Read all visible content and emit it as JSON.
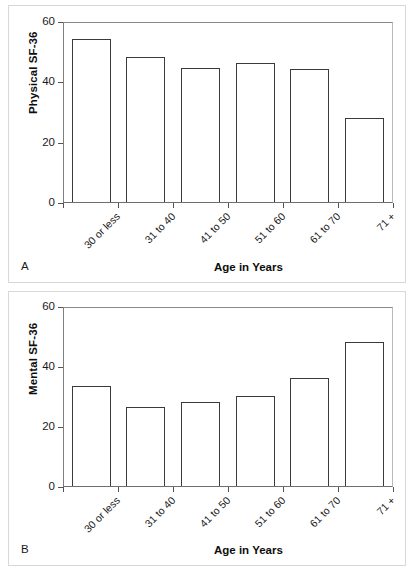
{
  "figure": {
    "panels": [
      {
        "letter": "A",
        "y_title": "Physical SF-36",
        "x_title": "Age in Years"
      },
      {
        "letter": "B",
        "y_title": "Mental SF-36",
        "x_title": "Age in Years"
      }
    ]
  },
  "chart_data": [
    {
      "type": "bar",
      "title": "A",
      "panel_letter": "A",
      "categories": [
        "30 or less",
        "31 to 40",
        "41 to 50",
        "51 to 60",
        "61 to 70",
        "71 +"
      ],
      "values": [
        54,
        48,
        44.5,
        46,
        44,
        28
      ],
      "xlabel": "Age in Years",
      "ylabel": "Physical SF-36",
      "ylim": [
        0,
        60
      ],
      "yticks": [
        0,
        20,
        40,
        60
      ],
      "ytick_labels": [
        "0",
        "20",
        "40",
        "60"
      ],
      "grid": false,
      "legend": false
    },
    {
      "type": "bar",
      "title": "B",
      "panel_letter": "B",
      "categories": [
        "30 or less",
        "31 to 40",
        "41 to 50",
        "51 to 60",
        "61 to 70",
        "71 +"
      ],
      "values": [
        33.5,
        26.5,
        28,
        30,
        36,
        48
      ],
      "xlabel": "Age in Years",
      "ylabel": "Mental SF-36",
      "ylim": [
        0,
        60
      ],
      "yticks": [
        0,
        20,
        40,
        60
      ],
      "ytick_labels": [
        "0",
        "20",
        "40",
        "60"
      ],
      "grid": false,
      "legend": false
    }
  ]
}
